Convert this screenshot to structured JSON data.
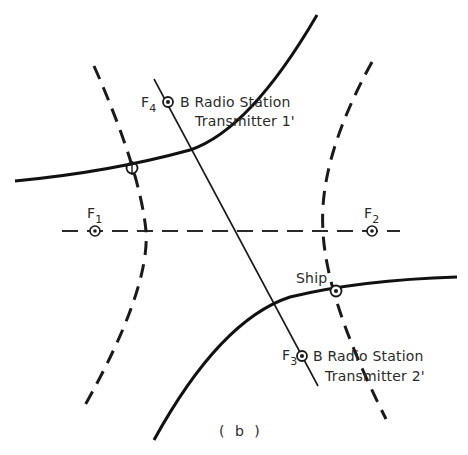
{
  "diagram": {
    "caption": "( b )",
    "foci": [
      {
        "id": "F1",
        "letter": "F",
        "subscript": "1"
      },
      {
        "id": "F2",
        "letter": "F",
        "subscript": "2"
      },
      {
        "id": "F3",
        "letter": "F",
        "subscript": "3"
      },
      {
        "id": "F4",
        "letter": "F",
        "subscript": "4"
      }
    ],
    "stations": [
      {
        "line1": "B  Radio Station",
        "line2": "Transmitter 1'"
      },
      {
        "line1": "B Radio Station",
        "line2": "Transmitter 2'"
      }
    ],
    "ship_label": "Ship",
    "legend_semantics": {
      "dashed_curves": "hyperbola branches with foci F1, F2",
      "solid_curves": "hyperbola branches with foci F3, F4",
      "dashed_line": "axis through F1 and F2",
      "thin_line": "axis through F3 and F4"
    },
    "colors": {
      "ink": "#1a1a1a",
      "background": "#ffffff"
    }
  }
}
